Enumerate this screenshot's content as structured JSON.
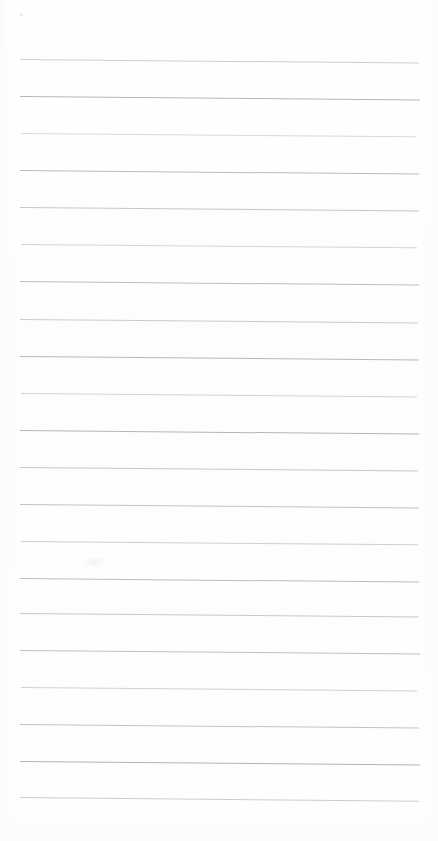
{
  "document": {
    "kind": "scanned-blank-ruled-notepaper",
    "page_label": "",
    "title_text": "",
    "body_text": "",
    "handwriting_text": "",
    "width_px": 438,
    "height_px": 841
  },
  "paper": {
    "background_color": "#fefefe",
    "surface_tone_color": "#fdfdfd",
    "edge_shade_color": "#fbfbfc"
  },
  "ruling": {
    "line_count": 21,
    "first_line_y": 59,
    "line_spacing_px": 37,
    "left_x": 20,
    "right_x": 419,
    "thickness_px": 1,
    "skew_px": 3.5,
    "base_color": "#c2c5c8",
    "dark_color": "#adb1b6",
    "light_color": "#d5d8db",
    "lines": [
      {
        "y": 59,
        "color": "#c6c9cc",
        "opacity": 0.88,
        "left": 20,
        "right": 419,
        "skew": 3.6
      },
      {
        "y": 96,
        "color": "#b1b5ba",
        "opacity": 1.0,
        "left": 20,
        "right": 420,
        "skew": 3.4
      },
      {
        "y": 133,
        "color": "#cdd0d3",
        "opacity": 0.82,
        "left": 21,
        "right": 416,
        "skew": 3.2
      },
      {
        "y": 170,
        "color": "#b6babe",
        "opacity": 0.98,
        "left": 20,
        "right": 419,
        "skew": 3.6
      },
      {
        "y": 207,
        "color": "#bfc2c6",
        "opacity": 0.92,
        "left": 20,
        "right": 419,
        "skew": 3.5
      },
      {
        "y": 244,
        "color": "#cacdd0",
        "opacity": 0.84,
        "left": 21,
        "right": 417,
        "skew": 3.3
      },
      {
        "y": 281,
        "color": "#b8bcc0",
        "opacity": 0.96,
        "left": 20,
        "right": 419,
        "skew": 3.6
      },
      {
        "y": 319,
        "color": "#c3c6ca",
        "opacity": 0.9,
        "left": 20,
        "right": 418,
        "skew": 3.5
      },
      {
        "y": 356,
        "color": "#b4b8bc",
        "opacity": 0.98,
        "left": 20,
        "right": 419,
        "skew": 3.4
      },
      {
        "y": 393,
        "color": "#c8cbce",
        "opacity": 0.86,
        "left": 21,
        "right": 417,
        "skew": 3.5
      },
      {
        "y": 430,
        "color": "#b2b6bb",
        "opacity": 1.0,
        "left": 20,
        "right": 419,
        "skew": 3.6
      },
      {
        "y": 467,
        "color": "#c0c3c7",
        "opacity": 0.92,
        "left": 20,
        "right": 418,
        "skew": 3.4
      },
      {
        "y": 504,
        "color": "#bbbfc3",
        "opacity": 0.94,
        "left": 20,
        "right": 419,
        "skew": 3.5
      },
      {
        "y": 541,
        "color": "#c5c8cb",
        "opacity": 0.88,
        "left": 21,
        "right": 418,
        "skew": 3.3
      },
      {
        "y": 578,
        "color": "#b6babf",
        "opacity": 0.97,
        "left": 20,
        "right": 419,
        "skew": 3.6
      },
      {
        "y": 613,
        "color": "#c1c4c8",
        "opacity": 0.91,
        "left": 20,
        "right": 419,
        "skew": 3.5
      },
      {
        "y": 650,
        "color": "#b9bdc1",
        "opacity": 0.95,
        "left": 20,
        "right": 420,
        "skew": 3.4
      },
      {
        "y": 687,
        "color": "#c7cacd",
        "opacity": 0.86,
        "left": 21,
        "right": 417,
        "skew": 3.5
      },
      {
        "y": 724,
        "color": "#bcc0c4",
        "opacity": 0.94,
        "left": 20,
        "right": 419,
        "skew": 3.6
      },
      {
        "y": 761,
        "color": "#b0b4b9",
        "opacity": 1.0,
        "left": 20,
        "right": 420,
        "skew": 3.5
      },
      {
        "y": 797,
        "color": "#c4c7cb",
        "opacity": 0.89,
        "left": 20,
        "right": 419,
        "skew": 3.8
      }
    ]
  },
  "marks": [
    {
      "name": "top-left-speck",
      "x": 20,
      "y": 13,
      "size": 3,
      "color": "#e4e6e8"
    },
    {
      "name": "mid-left-smudge",
      "x": 84,
      "y": 556,
      "width": 22,
      "height": 12
    }
  ],
  "margins": {
    "top_blank_px": 59,
    "bottom_blank_px": 44,
    "left_px": 20,
    "right_px": 19
  }
}
